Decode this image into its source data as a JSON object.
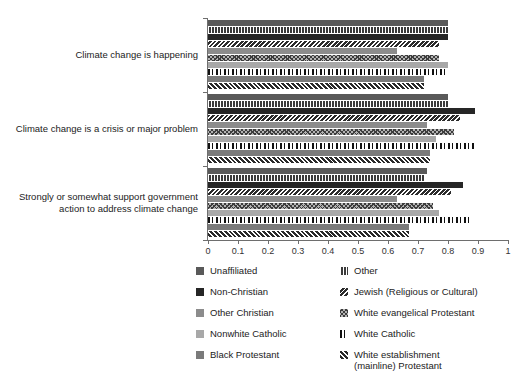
{
  "chart_data": {
    "type": "bar",
    "orientation": "horizontal",
    "title": "",
    "xlabel": "",
    "ylabel": "",
    "xlim": [
      0,
      1
    ],
    "xticks": [
      "0",
      "0.1",
      "0.2",
      "0.3",
      "0.4",
      "0.5",
      "0.6",
      "0.7",
      "0.8",
      "0.9",
      "1"
    ],
    "xtick_values": [
      0,
      0.1,
      0.2,
      0.3,
      0.4,
      0.5,
      0.6,
      0.7,
      0.8,
      0.9,
      1
    ],
    "grid": false,
    "legend_position": "bottom",
    "categories": [
      "Climate change is happening",
      "Climate change is a crisis or major problem",
      "Strongly or somewhat support government action to address climate change"
    ],
    "series": [
      {
        "name": "Unaffiliated",
        "pattern": "solid-dark-grey",
        "values": [
          0.8,
          0.8,
          0.73
        ]
      },
      {
        "name": "Other",
        "pattern": "vertical-stripes",
        "values": [
          0.8,
          0.8,
          0.72
        ]
      },
      {
        "name": "Non-Christian",
        "pattern": "solid-near-black",
        "values": [
          0.8,
          0.89,
          0.85
        ]
      },
      {
        "name": "Jewish (Religious or Cultural)",
        "pattern": "backslash-diagonal",
        "values": [
          0.77,
          0.84,
          0.81
        ]
      },
      {
        "name": "Other Christian",
        "pattern": "solid-mid-grey",
        "values": [
          0.63,
          0.73,
          0.63
        ]
      },
      {
        "name": "White evangelical Protestant",
        "pattern": "diamond-hatch",
        "values": [
          0.77,
          0.82,
          0.75
        ]
      },
      {
        "name": "Nonwhite Catholic",
        "pattern": "solid-light-grey",
        "values": [
          0.8,
          0.76,
          0.77
        ]
      },
      {
        "name": "White Catholic",
        "pattern": "speckled-dots",
        "values": [
          0.8,
          0.89,
          0.87
        ]
      },
      {
        "name": "Black Protestant",
        "pattern": "solid-grey",
        "values": [
          0.72,
          0.74,
          0.67
        ]
      },
      {
        "name": "White establishment (mainline) Protestant",
        "pattern": "forward-diagonal",
        "values": [
          0.72,
          0.74,
          0.67
        ]
      }
    ]
  },
  "axis": {
    "x_ticks": [
      {
        "label": "0",
        "value": 0
      },
      {
        "label": "0.1",
        "value": 0.1
      },
      {
        "label": "0.2",
        "value": 0.2
      },
      {
        "label": "0.3",
        "value": 0.3
      },
      {
        "label": "0.4",
        "value": 0.4
      },
      {
        "label": "0.5",
        "value": 0.5
      },
      {
        "label": "0.6",
        "value": 0.6
      },
      {
        "label": "0.7",
        "value": 0.7
      },
      {
        "label": "0.8",
        "value": 0.8
      },
      {
        "label": "0.9",
        "value": 0.9
      },
      {
        "label": "1",
        "value": 1
      }
    ]
  },
  "categories_labels": [
    {
      "line1": "Climate change is happening",
      "line2": ""
    },
    {
      "line1": "Climate change is a crisis or major problem",
      "line2": ""
    },
    {
      "line1": "Strongly or somewhat support government",
      "line2": "action to address climate change"
    }
  ],
  "legend": {
    "left_column": [
      {
        "label": "Unaffiliated",
        "pattern": "solid-dark-grey"
      },
      {
        "label": "Non-Christian",
        "pattern": "solid-near-black"
      },
      {
        "label": "Other Christian",
        "pattern": "solid-mid-grey"
      },
      {
        "label": "Nonwhite Catholic",
        "pattern": "solid-light-grey"
      },
      {
        "label": "Black Protestant",
        "pattern": "solid-grey"
      }
    ],
    "right_column": [
      {
        "label": "Other",
        "pattern": "vertical-stripes"
      },
      {
        "label": "Jewish (Religious or Cultural)",
        "pattern": "backslash-diagonal"
      },
      {
        "label": "White evangelical Protestant",
        "pattern": "diamond-hatch"
      },
      {
        "label": "White Catholic",
        "pattern": "speckled-dots"
      },
      {
        "label": "White establishment",
        "pattern": "forward-diagonal",
        "label_line2": "(mainline) Protestant"
      }
    ]
  },
  "colors": {
    "axis": "#6e6e6e",
    "text": "#222222",
    "background": "#ffffff"
  }
}
